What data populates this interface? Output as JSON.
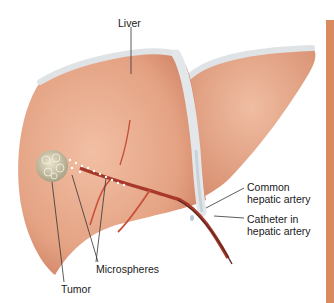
{
  "figure": {
    "subject": "liver",
    "labels": {
      "liver": "Liver",
      "common_artery_line1": "Common",
      "common_artery_line2": "hepatic artery",
      "catheter_line1": "Catheter in",
      "catheter_line2": "hepatic artery",
      "microspheres": "Microspheres",
      "tumor": "Tumor"
    },
    "colors": {
      "liver_fill": "#e8a88a",
      "liver_shadow": "#d4886a",
      "ligament": "#dfe3e6",
      "artery": "#c8503a",
      "tumor": "#c9c2a8",
      "accent_bar": "#d98a5e"
    }
  }
}
